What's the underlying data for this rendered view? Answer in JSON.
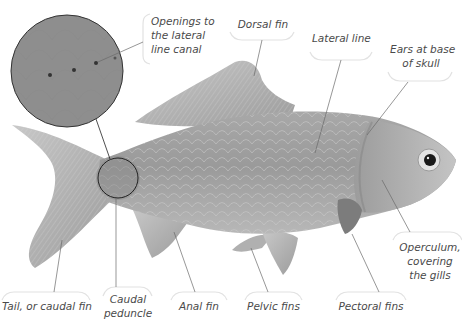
{
  "diagram": {
    "inset": {
      "description": "Magnified view of scales near caudal peduncle"
    },
    "labels": [
      {
        "id": "openings",
        "lines": [
          "Openings to",
          "the lateral",
          "line canal"
        ]
      },
      {
        "id": "dorsal",
        "lines": [
          "Dorsal fin"
        ]
      },
      {
        "id": "lateral",
        "lines": [
          "Lateral line"
        ]
      },
      {
        "id": "ears",
        "lines": [
          "Ears at base",
          "of skull"
        ]
      },
      {
        "id": "operculum",
        "lines": [
          "Operculum,",
          "covering",
          "the gills"
        ]
      },
      {
        "id": "tail",
        "lines": [
          "Tail, or caudal fin"
        ]
      },
      {
        "id": "peduncle",
        "lines": [
          "Caudal",
          "peduncle"
        ]
      },
      {
        "id": "anal",
        "lines": [
          "Anal fin"
        ]
      },
      {
        "id": "pelvic",
        "lines": [
          "Pelvic fins"
        ]
      },
      {
        "id": "pectoral",
        "lines": [
          "Pectoral fins"
        ]
      }
    ],
    "colors": {
      "background": "#ffffff",
      "fish_body": "#9a9a9a",
      "fish_dark": "#6e6e6e",
      "fin": "#b4b4b4",
      "bracket": "#e2e2e2",
      "leader": "#6a6a6a",
      "text": "#4a4a4a"
    }
  }
}
